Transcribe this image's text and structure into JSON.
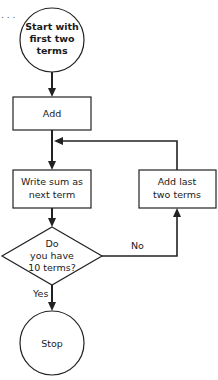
{
  "diagram": {
    "type": "flowchart",
    "leading_ellipsis": ". . .",
    "nodes": {
      "start": {
        "shape": "circle",
        "lines": [
          "Start with",
          "first two",
          "terms"
        ]
      },
      "add": {
        "shape": "rectangle",
        "lines": [
          "Add"
        ]
      },
      "write_sum": {
        "shape": "rectangle",
        "lines": [
          "Write sum as",
          "next term"
        ]
      },
      "decision": {
        "shape": "diamond",
        "lines": [
          "Do",
          "you have",
          "10 terms?"
        ]
      },
      "add_last": {
        "shape": "rectangle",
        "lines": [
          "Add last",
          "two terms"
        ]
      },
      "stop": {
        "shape": "circle",
        "lines": [
          "Stop"
        ]
      }
    },
    "edges": [
      {
        "from": "start",
        "to": "add",
        "label": ""
      },
      {
        "from": "add",
        "to": "write_sum",
        "label": ""
      },
      {
        "from": "write_sum",
        "to": "decision",
        "label": ""
      },
      {
        "from": "decision",
        "to": "add_last",
        "label": "No"
      },
      {
        "from": "add_last",
        "to": "write_sum",
        "label": ""
      },
      {
        "from": "decision",
        "to": "stop",
        "label": "Yes"
      }
    ],
    "edge_labels": {
      "no": "No",
      "yes": "Yes"
    },
    "colors": {
      "stroke": "#222222",
      "background": "#ffffff",
      "text": "#1a1a1a"
    }
  }
}
